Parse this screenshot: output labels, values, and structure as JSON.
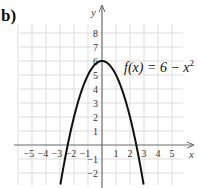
{
  "panel_label": "b)",
  "chart_data": {
    "type": "line",
    "title": "",
    "function_label": {
      "prefix": "f(x) = 6 − x",
      "exponent": "2"
    },
    "xlabel": "x",
    "ylabel": "y",
    "xlim": [
      -6,
      6
    ],
    "ylim": [
      -3,
      9
    ],
    "grid": true,
    "x_ticks": [
      -5,
      -4,
      -3,
      -2,
      -1,
      1,
      2,
      3,
      4,
      5
    ],
    "x_tick_labels": [
      "−5",
      "−4",
      "−3",
      "−2",
      "−1",
      "1",
      "2",
      "3",
      "4",
      "5"
    ],
    "y_ticks": [
      -2,
      -1,
      1,
      2,
      3,
      4,
      5,
      6,
      7,
      8
    ],
    "y_tick_labels": [
      "−2",
      "−1",
      "1",
      "2",
      "3",
      "4",
      "5",
      "6",
      "7",
      "8"
    ],
    "series": [
      {
        "name": "f(x) = 6 - x^2",
        "expression": "6 - x^2",
        "x_range": [
          -2.97,
          2.97
        ],
        "points": [
          [
            -2.97,
            -2.82
          ],
          [
            -2.5,
            -0.25
          ],
          [
            -2.449,
            0
          ],
          [
            -2,
            2
          ],
          [
            -1.5,
            3.75
          ],
          [
            -1,
            5
          ],
          [
            -0.5,
            5.75
          ],
          [
            0,
            6
          ],
          [
            0.5,
            5.75
          ],
          [
            1,
            5
          ],
          [
            1.5,
            3.75
          ],
          [
            2,
            2
          ],
          [
            2.449,
            0
          ],
          [
            2.5,
            -0.25
          ],
          [
            2.97,
            -2.82
          ]
        ]
      }
    ],
    "colors": {
      "grid": "#d4d4d4",
      "axis": "#6b6b6b",
      "curve": "#111111"
    }
  }
}
